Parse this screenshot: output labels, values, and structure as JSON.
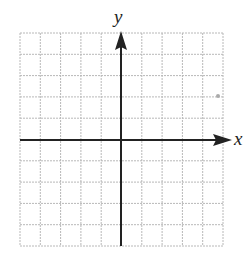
{
  "diagram": {
    "type": "coordinate-plane",
    "axis_labels": {
      "x": "x",
      "y": "y"
    },
    "grid": {
      "columns": 10,
      "rows": 10,
      "left": 20,
      "top": 33,
      "right": 223,
      "bottom": 246
    },
    "origin": {
      "x": 121,
      "y": 140
    },
    "colors": {
      "grid": "#b8b8b8",
      "axis": "#222222",
      "background": "#ffffff"
    }
  }
}
